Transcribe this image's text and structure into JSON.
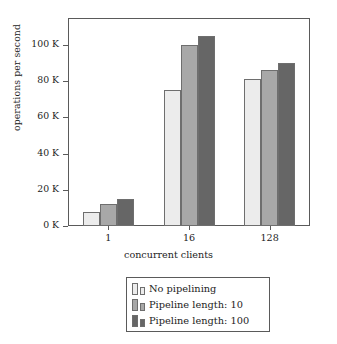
{
  "chart_data": {
    "type": "bar",
    "title": "",
    "xlabel": "concurrent clients",
    "ylabel": "operations per second",
    "categories": [
      "1",
      "16",
      "128"
    ],
    "ylim": [
      0,
      115000
    ],
    "yticks": [
      0,
      20000,
      40000,
      60000,
      80000,
      100000
    ],
    "ytick_labels": [
      "0 K",
      "20 K",
      "40 K",
      "60 K",
      "80 K",
      "100 K"
    ],
    "grid": false,
    "legend_position": "below-axes",
    "series": [
      {
        "name": "No pipelining",
        "color": "#ececec",
        "values": [
          8000,
          75000,
          81000
        ]
      },
      {
        "name": "Pipeline length: 10",
        "color": "#a8a8a8",
        "values": [
          12000,
          100000,
          86000
        ]
      },
      {
        "name": "Pipeline length: 100",
        "color": "#666666",
        "values": [
          15000,
          105000,
          90000
        ]
      }
    ]
  },
  "axes": {
    "y_title": "operations per second",
    "x_title": "concurrent clients",
    "y_tick_labels": [
      "0 K",
      "20 K",
      "40 K",
      "60 K",
      "80 K",
      "100 K"
    ],
    "x_tick_labels": [
      "1",
      "16",
      "128"
    ]
  },
  "legend": {
    "entries": [
      {
        "label": "No pipelining"
      },
      {
        "label": "Pipeline length: 10"
      },
      {
        "label": "Pipeline length: 100"
      }
    ]
  },
  "colors": {
    "series_1": "#ececec",
    "series_2": "#a8a8a8",
    "series_3": "#666666",
    "frame": "#5a5a5a",
    "text": "#1c1c1c"
  }
}
